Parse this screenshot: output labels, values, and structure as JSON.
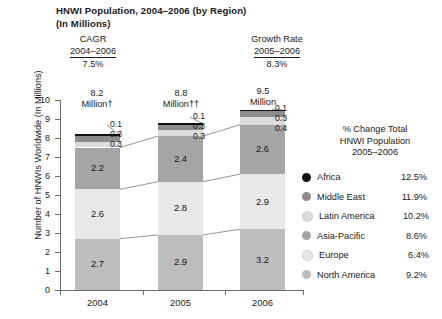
{
  "title": {
    "line1": "HNWI Population, 2004–2006 (by Region)",
    "line2": "(In Millions)"
  },
  "header_stats": [
    {
      "label": "CAGR",
      "range": "2004–2006",
      "value": "7.5%"
    },
    {
      "label": "Growth Rate",
      "range": "2005–2006",
      "value": "8.3%"
    }
  ],
  "bar_totals": [
    {
      "value": "8.2",
      "unit": "Million†"
    },
    {
      "value": "8.8",
      "unit": "Million††"
    },
    {
      "value": "9.5",
      "unit": "Million"
    }
  ],
  "axis": {
    "ylabel": "Number of HNWIs Worldwide (In Millions)",
    "yticks": [
      "10",
      "9",
      "8",
      "7",
      "6",
      "5",
      "4",
      "3",
      "2",
      "1",
      "0"
    ],
    "xticks": [
      "2004",
      "2005",
      "2006"
    ]
  },
  "legend": {
    "title_line1": "% Change Total",
    "title_line2": "HNWI Population",
    "title_line3": "2005–2006",
    "items": [
      {
        "name": "Africa",
        "pct": "12.5%",
        "color": "#111111"
      },
      {
        "name": "Middle East",
        "pct": "11.9%",
        "color": "#8c8c8c"
      },
      {
        "name": "Latin America",
        "pct": "10.2%",
        "color": "#dcdcdc"
      },
      {
        "name": "Asia-Pacific",
        "pct": "8.6%",
        "color": "#a5a5a5"
      },
      {
        "name": "Europe",
        "pct": "6.4%",
        "color": "#e8e8e8"
      },
      {
        "name": "North America",
        "pct": "9.2%",
        "color": "#bdbdbd"
      }
    ]
  },
  "chart_data": {
    "type": "bar",
    "stacked": true,
    "title": "HNWI Population, 2004–2006 (by Region)",
    "subtitle": "(In Millions)",
    "xlabel": "",
    "ylabel": "Number of HNWIs Worldwide (In Millions)",
    "ylim": [
      0,
      10
    ],
    "categories": [
      "2004",
      "2005",
      "2006"
    ],
    "totals": [
      8.2,
      8.8,
      9.5
    ],
    "grid": false,
    "legend_position": "right",
    "series": [
      {
        "name": "North America",
        "color": "#bdbdbd",
        "values": [
          2.7,
          2.9,
          3.2
        ],
        "labels": [
          "2.7",
          "2.9",
          "3.2"
        ]
      },
      {
        "name": "Europe",
        "color": "#e8e8e8",
        "values": [
          2.6,
          2.8,
          2.9
        ],
        "labels": [
          "2.6",
          "2.8",
          "2.9"
        ]
      },
      {
        "name": "Asia-Pacific",
        "color": "#a5a5a5",
        "values": [
          2.2,
          2.4,
          2.6
        ],
        "labels": [
          "2.2",
          "2.4",
          "2.6"
        ]
      },
      {
        "name": "Latin America",
        "color": "#dcdcdc",
        "values": [
          0.3,
          0.3,
          0.4
        ],
        "labels": [
          "0.3",
          "0.3",
          "0.4"
        ]
      },
      {
        "name": "Middle East",
        "color": "#8c8c8c",
        "values": [
          0.3,
          0.3,
          0.3
        ],
        "labels": [
          "0.3",
          "0.3",
          "0.3"
        ]
      },
      {
        "name": "Africa",
        "color": "#111111",
        "values": [
          0.1,
          0.1,
          0.1
        ],
        "labels": [
          "0.1",
          "0.1",
          "0.1"
        ]
      }
    ],
    "annotations": {
      "cagr_2004_2006": "7.5%",
      "growth_rate_2005_2006": "8.3%",
      "pct_change_2005_2006": {
        "Africa": "12.5%",
        "Middle East": "11.9%",
        "Latin America": "10.2%",
        "Asia-Pacific": "8.6%",
        "Europe": "6.4%",
        "North America": "9.2%"
      }
    },
    "callouts": [
      {
        "category": "2004",
        "values": [
          "0.1",
          "0.3",
          "0.3"
        ]
      },
      {
        "category": "2005",
        "values": [
          "0.1",
          "0.3",
          "0.3"
        ]
      },
      {
        "category": "2006",
        "values": [
          "0.1",
          "0.3",
          "0.4"
        ]
      }
    ]
  }
}
